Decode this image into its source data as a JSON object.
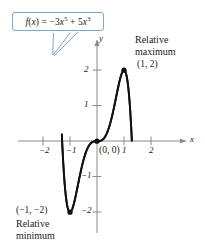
{
  "figure": {
    "equation_label": "f(x) = -3x^5 + 5x^3",
    "equation_parts": {
      "fx": "f",
      "paren_open": "(",
      "var": "x",
      "paren_close": ")",
      "equals": " = ",
      "term1_coef": "−3",
      "term1_var": "x",
      "term1_exp": "5",
      "plus": " + ",
      "term2_coef": "5",
      "term2_var": "x",
      "term2_exp": "3"
    },
    "callout_border_color": "#7da7c4",
    "curve_color": "#000000",
    "axis_color": "#808080",
    "annotations": {
      "max_line1": "Relative",
      "max_line2": "maximum",
      "max_point": "(1, 2)",
      "min_point": "(−1, −2)",
      "min_line1": "Relative",
      "min_line2": "minimum",
      "origin_point": "(0, 0)"
    },
    "axes": {
      "x_name": "x",
      "y_name": "y",
      "x_ticks": [
        "−2",
        "−1",
        "1",
        "2"
      ],
      "y_ticks": [
        "2",
        "1",
        "−1",
        "−2"
      ]
    }
  },
  "chart_data": {
    "type": "line",
    "title": "",
    "function": "f(x) = -3x^5 + 5x^3",
    "xlabel": "x",
    "ylabel": "y",
    "xlim": [
      -2.6,
      2.6
    ],
    "ylim": [
      -2.9,
      2.9
    ],
    "grid": false,
    "legend": null,
    "x_ticks": [
      -2,
      -1,
      1,
      2
    ],
    "y_ticks": [
      2,
      1,
      -1,
      -2
    ],
    "annotations": [
      {
        "text": "Relative maximum (1, 2)",
        "x": 1,
        "y": 2
      },
      {
        "text": "(-1, -2) Relative minimum",
        "x": -1,
        "y": -2
      },
      {
        "text": "(0, 0)",
        "x": 0,
        "y": 0
      }
    ],
    "marked_points": [
      {
        "label": "(1, 2)",
        "x": 1,
        "y": 2
      },
      {
        "label": "(0, 0)",
        "x": 0,
        "y": 0
      },
      {
        "label": "(-1, -2)",
        "x": -1,
        "y": -2
      }
    ],
    "series": [
      {
        "name": "f(x) = -3x^5 + 5x^3",
        "x": [
          -1.3,
          -1.25,
          -1.2,
          -1.15,
          -1.1,
          -1.05,
          -1.0,
          -0.95,
          -0.9,
          -0.85,
          -0.8,
          -0.75,
          -0.7,
          -0.65,
          -0.6,
          -0.55,
          -0.5,
          -0.45,
          -0.4,
          -0.35,
          -0.3,
          -0.25,
          -0.2,
          -0.15,
          -0.1,
          -0.05,
          0.0,
          0.05,
          0.1,
          0.15,
          0.2,
          0.25,
          0.3,
          0.35,
          0.4,
          0.45,
          0.5,
          0.55,
          0.6,
          0.65,
          0.7,
          0.75,
          0.8,
          0.85,
          0.9,
          0.95,
          1.0,
          1.05,
          1.1,
          1.15,
          1.2,
          1.25,
          1.3
        ],
        "y": [
          2.13,
          1.39,
          0.82,
          0.39,
          0.08,
          -0.13,
          -2.0,
          -0.24,
          -0.37,
          -0.45,
          -0.52,
          -0.57,
          -0.59,
          -0.59,
          -0.85,
          -0.53,
          -0.53,
          -0.48,
          -0.29,
          -0.18,
          -0.12,
          -0.07,
          -0.04,
          -0.02,
          -0.0,
          -0.0,
          0.0,
          0.0,
          0.0,
          0.02,
          0.04,
          0.07,
          0.12,
          0.18,
          0.29,
          0.41,
          0.53,
          0.72,
          0.85,
          0.93,
          1.21,
          1.4,
          1.58,
          1.78,
          1.88,
          1.96,
          2.0,
          1.87,
          1.56,
          0.99,
          0.08,
          -1.25,
          -2.95
        ]
      }
    ]
  }
}
